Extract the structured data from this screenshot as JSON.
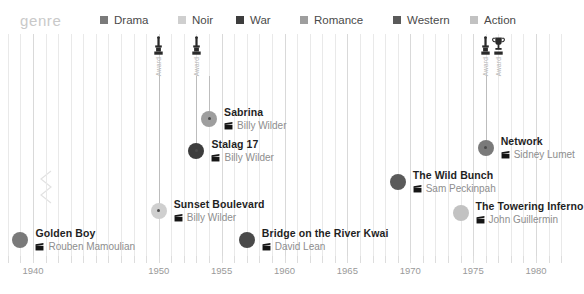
{
  "legend": {
    "title": "genre",
    "items": [
      {
        "label": "Drama",
        "color": "#7a7a7a"
      },
      {
        "label": "Noir",
        "color": "#cfcfcf"
      },
      {
        "label": "War",
        "color": "#3d3d3d"
      },
      {
        "label": "Romance",
        "color": "#9e9e9e"
      },
      {
        "label": "Western",
        "color": "#5a5a5a"
      },
      {
        "label": "Action",
        "color": "#c2c2c2"
      }
    ]
  },
  "axis": {
    "ticks": [
      1940,
      1950,
      1955,
      1960,
      1965,
      1970,
      1975,
      1980
    ],
    "labels": [
      "1940",
      "1950",
      "1955",
      "1960",
      "1965",
      "1970",
      "1975",
      "1980"
    ],
    "range": [
      1938,
      1982
    ]
  },
  "awards": [
    {
      "label": "Award",
      "year": 1950,
      "icon": "oscar-statuette-icon"
    },
    {
      "label": "Award",
      "year": 1953,
      "icon": "oscar-statuette-icon"
    },
    {
      "label": "Award",
      "year": 1976,
      "icon": "oscar-statuette-icon"
    },
    {
      "label": "Award",
      "year": 1977,
      "icon": "trophy-cup-icon"
    }
  ],
  "chart_data": {
    "type": "scatter",
    "title": "genre",
    "xlabel": "",
    "ylabel": "",
    "xlim": [
      1938,
      1982
    ],
    "grid": true,
    "legend_position": "top",
    "categories": [
      "Drama",
      "Noir",
      "War",
      "Romance",
      "Western",
      "Action"
    ],
    "points": [
      {
        "title": "Sabrina",
        "director": "Billy Wilder",
        "year": 1954,
        "genre": "Romance",
        "color": "#9e9e9e",
        "awarded": true
      },
      {
        "title": "Stalag 17",
        "director": "Billy Wilder",
        "year": 1953,
        "genre": "War",
        "color": "#3d3d3d",
        "awarded": true
      },
      {
        "title": "Sunset Boulevard",
        "director": "Billy Wilder",
        "year": 1950,
        "genre": "Noir",
        "color": "#cfcfcf",
        "awarded": true
      },
      {
        "title": "Golden Boy",
        "director": "Rouben Mamoulian",
        "year": 1939,
        "genre": "Drama",
        "color": "#7a7a7a",
        "awarded": false
      },
      {
        "title": "Bridge on the River Kwai",
        "director": "David Lean",
        "year": 1957,
        "genre": "War",
        "color": "#4a4a4a",
        "awarded": false
      },
      {
        "title": "The Wild Bunch",
        "director": "Sam Peckinpah",
        "year": 1969,
        "genre": "Western",
        "color": "#5a5a5a",
        "awarded": false
      },
      {
        "title": "The Towering Inferno",
        "director": "John Guillermin",
        "year": 1974,
        "genre": "Action",
        "color": "#c2c2c2",
        "awarded": false
      },
      {
        "title": "Network",
        "director": "Sidney Lumet",
        "year": 1976,
        "genre": "Drama",
        "color": "#7a7a7a",
        "awarded": true
      }
    ]
  }
}
